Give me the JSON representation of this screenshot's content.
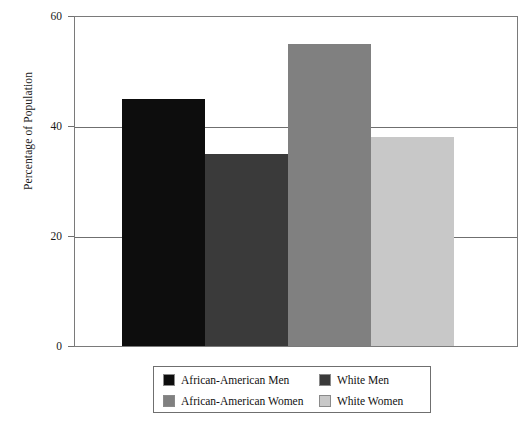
{
  "chart_data": {
    "type": "bar",
    "title": "",
    "xlabel": "",
    "ylabel": "Percentage of Population",
    "ylim": [
      0,
      60
    ],
    "yticks": [
      0,
      20,
      40,
      60
    ],
    "ytick_labels": [
      "0",
      "20",
      "40",
      "60"
    ],
    "grid": true,
    "legend_position": "bottom",
    "categories": [
      "African-American Men",
      "White Men",
      "African-American Women",
      "White Women"
    ],
    "values": [
      45,
      35,
      55,
      38
    ],
    "series": [
      {
        "name": "Percentage of Population",
        "values": [
          45,
          35,
          55,
          38
        ]
      }
    ],
    "bar_colors": [
      "#0d0d0d",
      "#3a3a3a",
      "#808080",
      "#c8c8c8"
    ],
    "bars": [
      {
        "label": "African-American Men",
        "value": 45,
        "color": "#0d0d0d"
      },
      {
        "label": "White Men",
        "value": 35,
        "color": "#3a3a3a"
      },
      {
        "label": "African-American Women",
        "value": 55,
        "color": "#808080"
      },
      {
        "label": "White Women",
        "value": 38,
        "color": "#c8c8c8"
      }
    ]
  },
  "axis": {
    "y_title": "Percentage of Population",
    "ticks": [
      {
        "label": "60",
        "value": 60
      },
      {
        "label": "40",
        "value": 40
      },
      {
        "label": "20",
        "value": 20
      },
      {
        "label": "0",
        "value": 0
      }
    ]
  },
  "legend": {
    "entries": [
      {
        "label": "African-American Men",
        "color": "#0d0d0d"
      },
      {
        "label": "White Men",
        "color": "#3a3a3a"
      },
      {
        "label": "African-American Women",
        "color": "#808080"
      },
      {
        "label": "White Women",
        "color": "#c8c8c8"
      }
    ]
  },
  "colors": {
    "frame": "#7a7a7a",
    "gridline": "#6f6f6f",
    "background": "#ffffff",
    "text": "#111111"
  }
}
